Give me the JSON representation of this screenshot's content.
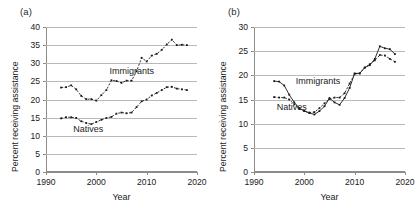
{
  "figure": {
    "width": 419,
    "height": 215,
    "background": "#ffffff",
    "ink_color": "#1a1a1a",
    "grid_color": "#b9b9b9",
    "axis_color": "#8c8c8c"
  },
  "panels": [
    {
      "key": "a",
      "label": "(a)",
      "ylabel": "Percent receiving assistance",
      "xlabel": "Year",
      "series_labels": {
        "immigrants": "Immigrants",
        "natives": "Natives"
      }
    },
    {
      "key": "b",
      "label": "(b)",
      "ylabel": "Percent receiving assistance",
      "xlabel": "Year",
      "series_labels": {
        "immigrants": "Immigrants",
        "natives": "Natives"
      }
    }
  ],
  "chart_data": [
    {
      "panel": "a",
      "type": "line",
      "title": "(a)",
      "xlabel": "Year",
      "ylabel": "Percent receiving assistance",
      "xlim": [
        1990,
        2020
      ],
      "ylim": [
        0,
        40
      ],
      "xticks": [
        1990,
        2000,
        2010,
        2020
      ],
      "yticks": [
        0,
        5,
        10,
        15,
        20,
        25,
        30,
        35,
        40
      ],
      "grid": true,
      "legend": "inline-annotations",
      "annotations": [
        {
          "text": "Immigrants",
          "x": 2002.6,
          "y": 27.6
        },
        {
          "text": "Natives",
          "x": 1995.4,
          "y": 11.6
        }
      ],
      "series": [
        {
          "name": "Immigrants",
          "style": "dashed-with-markers",
          "x": [
            1993,
            1994,
            1995,
            1996,
            1997,
            1998,
            1999,
            2000,
            2001,
            2002,
            2003,
            2004,
            2005,
            2006,
            2007,
            2008,
            2009,
            2010,
            2011,
            2012,
            2013,
            2014,
            2015,
            2016,
            2017,
            2018
          ],
          "values": [
            23.3,
            23.4,
            23.9,
            22.8,
            21.0,
            20.1,
            20.1,
            19.7,
            21.2,
            22.6,
            25.3,
            25.1,
            24.6,
            25.2,
            25.2,
            27.8,
            31.5,
            30.5,
            32.1,
            32.6,
            33.7,
            35.2,
            36.5,
            35.0,
            35.1,
            35.0
          ]
        },
        {
          "name": "Natives",
          "style": "dashed-with-markers",
          "x": [
            1993,
            1994,
            1995,
            1996,
            1997,
            1998,
            1999,
            2000,
            2001,
            2002,
            2003,
            2004,
            2005,
            2006,
            2007,
            2008,
            2009,
            2010,
            2011,
            2012,
            2013,
            2014,
            2015,
            2016,
            2017,
            2018
          ],
          "values": [
            14.8,
            15.1,
            15.1,
            14.9,
            14.0,
            13.5,
            13.2,
            13.8,
            14.4,
            14.9,
            15.2,
            16.1,
            16.4,
            16.2,
            16.4,
            17.9,
            19.5,
            20.0,
            21.1,
            21.8,
            22.6,
            23.4,
            23.5,
            23.0,
            22.8,
            22.6
          ]
        }
      ]
    },
    {
      "panel": "b",
      "type": "line",
      "title": "(b)",
      "xlabel": "Year",
      "ylabel": "Percent receiving assistance",
      "xlim": [
        1990,
        2020
      ],
      "ylim": [
        0,
        30
      ],
      "xticks": [
        1990,
        2000,
        2010,
        2020
      ],
      "yticks": [
        0,
        5,
        10,
        15,
        20,
        25,
        30
      ],
      "grid": true,
      "legend": "inline-annotations",
      "annotations": [
        {
          "text": "Immigrants",
          "x": 1998.3,
          "y": 18.6
        },
        {
          "text": "Natives",
          "x": 1994.5,
          "y": 13.2
        }
      ],
      "series": [
        {
          "name": "Immigrants",
          "style": "solid-with-markers",
          "x": [
            1994,
            1995,
            1996,
            1997,
            1998,
            1999,
            2000,
            2001,
            2002,
            2003,
            2004,
            2005,
            2006,
            2007,
            2008,
            2009,
            2010,
            2011,
            2012,
            2013,
            2014,
            2015,
            2016,
            2017,
            2018
          ],
          "values": [
            18.8,
            18.7,
            17.9,
            16.0,
            14.4,
            13.2,
            12.6,
            12.2,
            11.9,
            12.6,
            13.6,
            15.3,
            14.4,
            13.9,
            15.3,
            17.4,
            20.4,
            20.4,
            21.6,
            22.1,
            23.4,
            26.0,
            25.6,
            25.4,
            24.4
          ]
        },
        {
          "name": "Natives",
          "style": "dashed-with-markers",
          "x": [
            1994,
            1995,
            1996,
            1997,
            1998,
            1999,
            2000,
            2001,
            2002,
            2003,
            2004,
            2005,
            2006,
            2007,
            2008,
            2009,
            2010,
            2011,
            2012,
            2013,
            2014,
            2015,
            2016,
            2017,
            2018
          ],
          "values": [
            15.5,
            15.4,
            15.4,
            15.0,
            14.0,
            13.1,
            12.6,
            12.3,
            12.4,
            13.2,
            14.2,
            15.1,
            15.4,
            15.4,
            16.3,
            18.3,
            20.3,
            20.4,
            21.6,
            22.3,
            23.1,
            24.2,
            24.1,
            23.4,
            22.8
          ]
        }
      ]
    }
  ]
}
